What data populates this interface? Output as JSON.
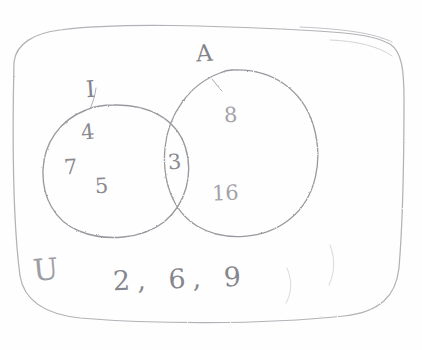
{
  "figure": {
    "kind": "hand-drawn pencil Venn diagram",
    "medium": "pencil on white paper",
    "ink_color": "#8a8a90",
    "paper_color": "#fefefe"
  },
  "universe": {
    "symbol": "U",
    "box_name": "universal-set-rectangle",
    "outside_elements_text": "2, 6, 9",
    "outside_elements": [
      "2",
      "6",
      "9"
    ]
  },
  "sets": [
    {
      "id": "left",
      "label": "I",
      "label_name": "set-label-i",
      "only_elements": [
        "4",
        "7",
        "5"
      ]
    },
    {
      "id": "right",
      "label": "A",
      "label_name": "set-label-a",
      "only_elements": [
        "8",
        "16"
      ]
    }
  ],
  "intersection": {
    "label": "I ∩ A",
    "elements": [
      "3"
    ]
  },
  "elements": {
    "left_only": {
      "e1": "4",
      "e2": "7",
      "e3": "5"
    },
    "intersection": {
      "e1": "3"
    },
    "right_only": {
      "e1": "8",
      "e2": "16"
    }
  },
  "stray_marks": {
    "count": 2,
    "description": "two faint curved pencil strokes near bottom right"
  }
}
